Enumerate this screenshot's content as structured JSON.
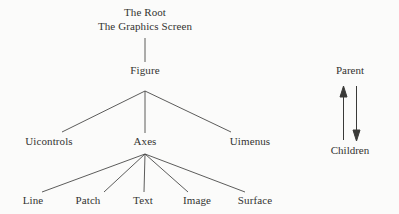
{
  "diagram": {
    "title_hidden": "",
    "background_color": "#fbfbfa",
    "line_color": "#4a4a48",
    "text_color": "#333331",
    "root": {
      "line1": "The Root",
      "line2": "The Graphics Screen"
    },
    "figure": {
      "label": "Figure"
    },
    "level2": [
      {
        "label": "Uicontrols"
      },
      {
        "label": "Axes"
      },
      {
        "label": "Uimenus"
      }
    ],
    "level3": [
      {
        "label": "Line"
      },
      {
        "label": "Patch"
      },
      {
        "label": "Text"
      },
      {
        "label": "Image"
      },
      {
        "label": "Surface"
      }
    ]
  },
  "legend": {
    "parent_label": "Parent",
    "children_label": "Children",
    "up_arrow_name": "arrow-up-icon",
    "down_arrow_name": "arrow-down-icon"
  }
}
